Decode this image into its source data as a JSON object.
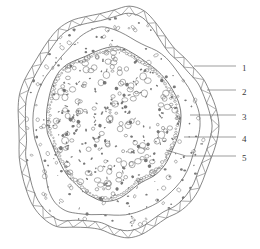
{
  "figure": {
    "type": "biological-cross-section-diagram",
    "background_color": "#ffffff",
    "line_color": "#555555",
    "label_color": "#3a3a3a"
  },
  "callouts": [
    {
      "id": "callout-1",
      "label": "1",
      "label_x": 242,
      "label_y": 68,
      "line": [
        [
          194,
          66
        ],
        [
          236,
          66
        ]
      ]
    },
    {
      "id": "callout-2",
      "label": "2",
      "label_x": 242,
      "label_y": 92,
      "line": [
        [
          207,
          90
        ],
        [
          236,
          90
        ]
      ]
    },
    {
      "id": "callout-3",
      "label": "3",
      "label_x": 242,
      "label_y": 117,
      "line": [
        [
          190,
          115
        ],
        [
          236,
          115
        ]
      ]
    },
    {
      "id": "callout-4",
      "label": "4",
      "label_x": 242,
      "label_y": 139,
      "line": [
        [
          184,
          137
        ],
        [
          236,
          137
        ]
      ]
    },
    {
      "id": "callout-5",
      "label": "5",
      "label_x": 242,
      "label_y": 158,
      "line": [
        [
          166,
          150
        ],
        [
          186,
          156
        ],
        [
          236,
          156
        ]
      ]
    }
  ],
  "zones": [
    {
      "id": "zone-outer-band",
      "name": "outer-hatched-band",
      "pattern": "zigzag-triangles"
    },
    {
      "id": "zone-middle",
      "name": "middle-sparse-layer",
      "pattern": "sparse-specks"
    },
    {
      "id": "zone-inner",
      "name": "inner-dense-core",
      "pattern": "dense-circles"
    }
  ]
}
